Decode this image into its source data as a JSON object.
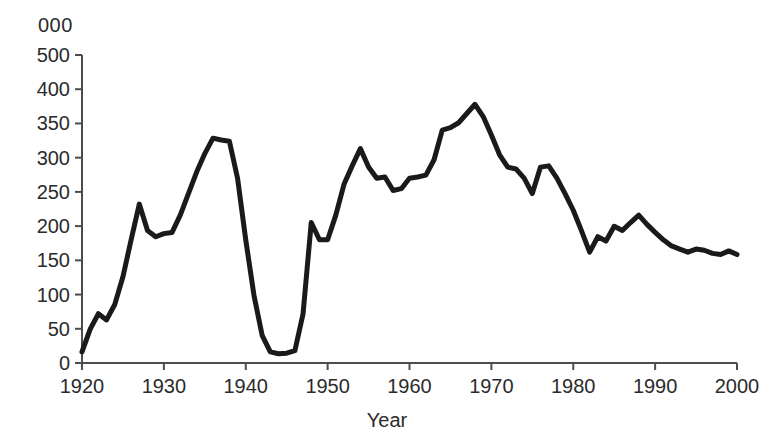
{
  "figure": {
    "units_label": "000",
    "background_color": "#ffffff",
    "line_color": "#1a1a1a",
    "axis_color": "#4d4d4d"
  },
  "chart_data": {
    "type": "line",
    "title": "",
    "subtitle": "",
    "units_note": "000",
    "xlabel": "Year",
    "ylabel": "",
    "xlim": [
      1920,
      2000
    ],
    "ylim": [
      0,
      500
    ],
    "grid": false,
    "legend": null,
    "x_tick_labels": [
      "1920",
      "1930",
      "1940",
      "1950",
      "1960",
      "1970",
      "1980",
      "1990",
      "2000"
    ],
    "x_ticks": [
      1920,
      1930,
      1940,
      1950,
      1960,
      1970,
      1980,
      1990,
      2000
    ],
    "y_tick_labels": [
      "500",
      "400",
      "350",
      "300",
      "250",
      "200",
      "150",
      "100",
      "50",
      "0"
    ],
    "y_ticks": [
      500,
      450,
      400,
      350,
      300,
      250,
      200,
      150,
      100,
      50,
      0
    ],
    "series": [
      {
        "name": "series-1",
        "x": [
          1920,
          1921,
          1922,
          1923,
          1924,
          1925,
          1926,
          1927,
          1928,
          1929,
          1930,
          1931,
          1932,
          1933,
          1934,
          1935,
          1936,
          1937,
          1938,
          1939,
          1940,
          1941,
          1942,
          1943,
          1944,
          1945,
          1946,
          1947,
          1948,
          1949,
          1950,
          1951,
          1952,
          1953,
          1954,
          1955,
          1956,
          1957,
          1958,
          1959,
          1960,
          1961,
          1962,
          1963,
          1964,
          1965,
          1966,
          1967,
          1968,
          1969,
          1970,
          1971,
          1972,
          1973,
          1974,
          1975,
          1976,
          1977,
          1978,
          1979,
          1980,
          1981,
          1982,
          1983,
          1984,
          1985,
          1986,
          1987,
          1988,
          1989,
          1990,
          1991,
          1992,
          1993,
          1994,
          1995,
          1996,
          1997,
          1998,
          1999,
          2000
        ],
        "y": [
          18,
          55,
          80,
          70,
          95,
          140,
          200,
          258,
          215,
          205,
          210,
          212,
          240,
          275,
          310,
          340,
          365,
          362,
          360,
          300,
          200,
          110,
          45,
          18,
          15,
          16,
          20,
          80,
          228,
          200,
          200,
          240,
          290,
          320,
          348,
          318,
          300,
          302,
          280,
          283,
          300,
          302,
          305,
          330,
          378,
          382,
          390,
          405,
          420,
          400,
          370,
          338,
          318,
          315,
          300,
          275,
          318,
          320,
          300,
          275,
          248,
          215,
          180,
          205,
          198,
          222,
          215,
          228,
          240,
          225,
          212,
          200,
          190,
          185,
          180,
          185,
          183,
          178,
          176,
          182,
          176
        ]
      }
    ]
  }
}
